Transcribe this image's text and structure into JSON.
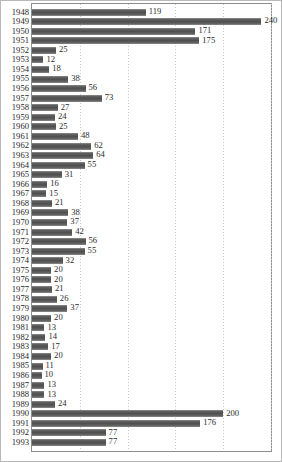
{
  "chart_data": {
    "type": "bar",
    "orientation": "horizontal",
    "title": "",
    "subtitle": "",
    "xlabel": "",
    "ylabel": "",
    "xlim": [
      0,
      250
    ],
    "ylim": null,
    "grid": true,
    "grid_axis": "x",
    "grid_style": "dotted",
    "gridline_values": [
      50,
      100,
      150,
      200,
      250
    ],
    "legend": null,
    "legend_position": "none",
    "value_labels": true,
    "bar_color": "#585858",
    "gridline_color": "#c9c9c9",
    "plot_border_color": "#8d8d8d",
    "categories": [
      "1948",
      "1949",
      "1950",
      "1951",
      "1952",
      "1953",
      "1954",
      "1955",
      "1956",
      "1957",
      "1958",
      "1959",
      "1960",
      "1961",
      "1962",
      "1963",
      "1964",
      "1965",
      "1966",
      "1967",
      "1968",
      "1969",
      "1970",
      "1971",
      "1972",
      "1973",
      "1974",
      "1975",
      "1976",
      "1977",
      "1978",
      "1979",
      "1980",
      "1981",
      "1982",
      "1983",
      "1984",
      "1985",
      "1986",
      "1987",
      "1988",
      "1989",
      "1990",
      "1991",
      "1992",
      "1993"
    ],
    "values": [
      119,
      240,
      171,
      175,
      25,
      12,
      18,
      38,
      56,
      73,
      27,
      24,
      25,
      48,
      62,
      64,
      55,
      31,
      16,
      15,
      21,
      38,
      37,
      42,
      56,
      55,
      32,
      20,
      20,
      21,
      26,
      37,
      20,
      13,
      14,
      17,
      20,
      11,
      10,
      13,
      13,
      24,
      200,
      176,
      77,
      77
    ]
  }
}
